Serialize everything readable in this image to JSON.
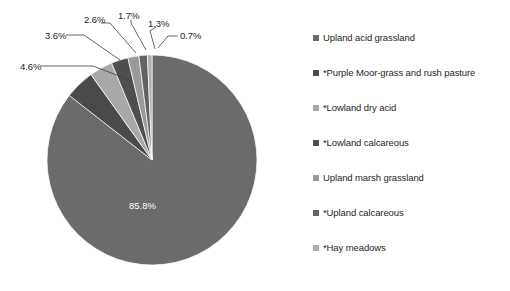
{
  "chart_data": {
    "type": "pie",
    "title": "",
    "legend_position": "right",
    "categories": [
      "Upland acid grassland",
      "*Purple Moor-grass and rush pasture",
      "*Lowland dry acid",
      "*Lowland calcareous",
      "Upland marsh grassland",
      "*Upland calcareous",
      "*Hay meadows"
    ],
    "values": [
      85.8,
      4.6,
      3.6,
      2.6,
      1.7,
      1.3,
      0.7
    ],
    "value_labels": [
      "85.8%",
      "4.6%",
      "3.6%",
      "2.6%",
      "1.7%",
      "1.3%",
      "0.7%"
    ],
    "colors": [
      "#6b6b6b",
      "#4a4a4a",
      "#a8a8a8",
      "#4f4f4f",
      "#9a9a9a",
      "#636363",
      "#b0b0b0"
    ],
    "slices": [
      {
        "label": "Upland acid grassland",
        "value": 85.8,
        "value_label": "85.8%",
        "color": "#6b6b6b"
      },
      {
        "label": "*Purple Moor-grass and rush pasture",
        "value": 4.6,
        "value_label": "4.6%",
        "color": "#4a4a4a"
      },
      {
        "label": "*Lowland dry acid",
        "value": 3.6,
        "value_label": "3.6%",
        "color": "#a8a8a8"
      },
      {
        "label": "*Lowland calcareous",
        "value": 2.6,
        "value_label": "2.6%",
        "color": "#4f4f4f"
      },
      {
        "label": "Upland marsh grassland",
        "value": 1.7,
        "value_label": "1.7%",
        "color": "#9a9a9a"
      },
      {
        "label": "*Upland calcareous",
        "value": 1.3,
        "value_label": "1.3%",
        "color": "#636363"
      },
      {
        "label": "*Hay meadows",
        "value": 0.7,
        "value_label": "0.7%",
        "color": "#b0b0b0"
      }
    ],
    "xlabel": "",
    "ylabel": ""
  },
  "legend": {
    "items": [
      {
        "label": "Upland acid grassland",
        "color": "#6b6b6b"
      },
      {
        "label": "*Purple Moor-grass and rush pasture",
        "color": "#4a4a4a"
      },
      {
        "label": "*Lowland dry acid",
        "color": "#a8a8a8"
      },
      {
        "label": "*Lowland calcareous",
        "color": "#4f4f4f"
      },
      {
        "label": "Upland marsh grassland",
        "color": "#9a9a9a"
      },
      {
        "label": "*Upland calcareous",
        "color": "#636363"
      },
      {
        "label": "*Hay meadows",
        "color": "#b0b0b0"
      }
    ]
  },
  "callouts": [
    {
      "value_label": "2.6%",
      "x": 84,
      "y": 14
    },
    {
      "value_label": "1.7%",
      "x": 118,
      "y": 10
    },
    {
      "value_label": "1.3%",
      "x": 148,
      "y": 18
    },
    {
      "value_label": "0.7%",
      "x": 180,
      "y": 30
    },
    {
      "value_label": "3.6%",
      "x": 45,
      "y": 30
    },
    {
      "value_label": "4.6%",
      "x": 20,
      "y": 61
    }
  ]
}
